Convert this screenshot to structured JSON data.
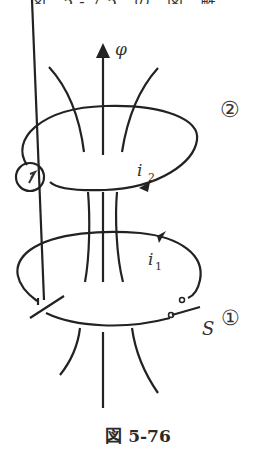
{
  "top_caption_partial": "図 5-75 の 図 解",
  "labels": {
    "flux": "φ",
    "coil2": "②",
    "coil1": "①",
    "current2_base": "i",
    "current2_sub": "2",
    "current1_base": "i",
    "current1_sub": "1",
    "switch": "S"
  },
  "figure_caption": "図 5-76"
}
